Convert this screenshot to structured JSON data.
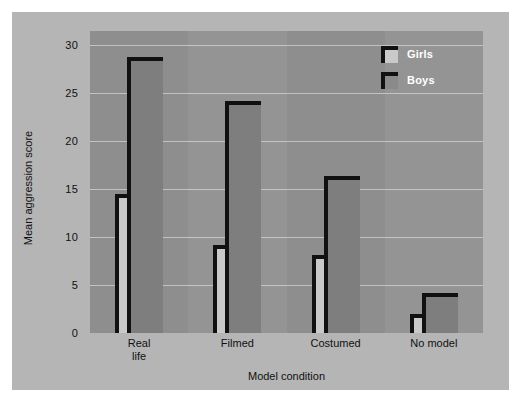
{
  "chart_data": {
    "type": "bar",
    "title": "",
    "xlabel": "Model condition",
    "ylabel": "Mean aggression score",
    "categories": [
      "Real\nlife",
      "Filmed",
      "Costumed",
      "No model"
    ],
    "series": [
      {
        "name": "Girls",
        "color": "#c9c9c9",
        "values": [
          14.5,
          9.2,
          8.1,
          2.0
        ]
      },
      {
        "name": "Boys",
        "color": "#7e7e7e",
        "values": [
          28.8,
          24.2,
          16.4,
          4.2
        ]
      }
    ],
    "ylim": [
      0,
      31.5
    ],
    "yticks": [
      0,
      5,
      10,
      15,
      20,
      25,
      30
    ],
    "ytick_labels": [
      "0",
      "5",
      "10",
      "15",
      "20",
      "25",
      "30"
    ],
    "grid": true,
    "legend_position": "top-right",
    "plot_background": "#8e8e8e",
    "figure_background": "#b5b5b5",
    "bar_outline_color": "#111111"
  }
}
